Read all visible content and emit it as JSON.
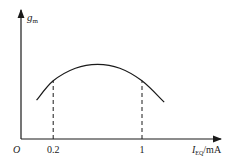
{
  "chart_data": {
    "type": "line",
    "title": "",
    "ylabel_main": "g",
    "ylabel_sub": "m",
    "xlabel_main": "I",
    "xlabel_sub": "EQ",
    "xlabel_unit": "/mA",
    "origin_label": "O",
    "x_ticks": [
      {
        "value": 0.2,
        "label": "0.2"
      },
      {
        "value": 1,
        "label": "1"
      }
    ],
    "xlim": [
      0,
      1.5
    ],
    "ylim": [
      0,
      1.15
    ],
    "series": [
      {
        "name": "g_m vs I_EQ",
        "x": [
          0.05,
          0.2,
          0.4,
          0.6,
          0.8,
          1.0,
          1.2
        ],
        "y": [
          0.4,
          0.6,
          0.73,
          0.77,
          0.73,
          0.6,
          0.38
        ]
      }
    ],
    "reference_lines": [
      {
        "x": 0.2,
        "style": "dashed"
      },
      {
        "x": 1,
        "style": "dashed"
      }
    ]
  },
  "colors": {
    "ink": "#1a1a1a",
    "background": "#ffffff"
  }
}
